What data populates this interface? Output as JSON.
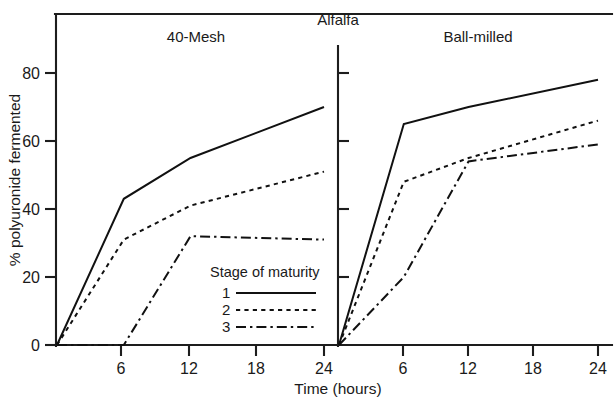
{
  "figure": {
    "group_title": "Alfalfa",
    "x_axis_title": "Time (hours)",
    "y_axis_title": "% polyuronide fermented"
  },
  "legend": {
    "title": "Stage of maturity",
    "entries": [
      {
        "label": "1",
        "style": "solid"
      },
      {
        "label": "2",
        "style": "dotted"
      },
      {
        "label": "3",
        "style": "dash-dot"
      }
    ]
  },
  "chart_data": {
    "type": "line",
    "title": "Alfalfa",
    "xlabel": "Time (hours)",
    "ylabel": "% polyuronide fermented",
    "xlim": [
      0,
      26
    ],
    "ylim": [
      0,
      95
    ],
    "xticks": [
      6,
      12,
      18,
      24
    ],
    "yticks": [
      0,
      20,
      40,
      60,
      80
    ],
    "grid": false,
    "legend_position": "inside-lower-center-left-panel",
    "panels": [
      {
        "name": "40-Mesh",
        "x": [
          0,
          6,
          12,
          24
        ],
        "series": [
          {
            "name": "1",
            "style": "solid",
            "values": [
              0,
              43,
              55,
              70
            ]
          },
          {
            "name": "2",
            "style": "dotted",
            "values": [
              0,
              31,
              41,
              51
            ]
          },
          {
            "name": "3",
            "style": "dash-dot",
            "values": [
              0,
              0,
              32,
              31
            ]
          }
        ]
      },
      {
        "name": "Ball-milled",
        "x": [
          0,
          6,
          12,
          24
        ],
        "series": [
          {
            "name": "1",
            "style": "solid",
            "values": [
              0,
              65,
              70,
              78
            ]
          },
          {
            "name": "2",
            "style": "dotted",
            "values": [
              0,
              48,
              55,
              66
            ]
          },
          {
            "name": "3",
            "style": "dash-dot",
            "values": [
              0,
              20,
              54,
              59
            ]
          }
        ]
      }
    ]
  }
}
